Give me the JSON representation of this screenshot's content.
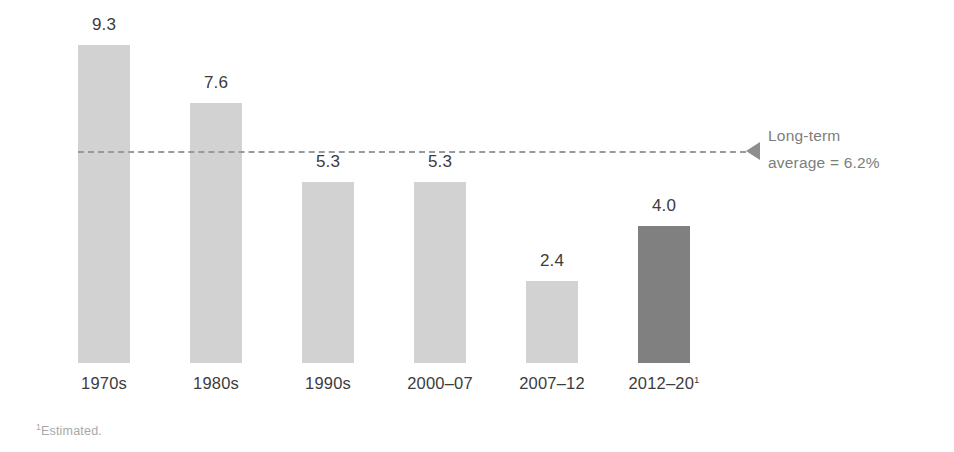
{
  "chart_data": {
    "type": "bar",
    "title": "",
    "subtitle": "",
    "xlabel": "",
    "ylabel": "",
    "categories": [
      "1970s",
      "1980s",
      "1990s",
      "2000–07",
      "2007–12",
      "2012–20"
    ],
    "category_labels": [
      "1970s",
      "1980s",
      "1990s",
      "2000–07",
      "2007–12",
      "2012–20"
    ],
    "category_footnote_markers": [
      "",
      "",
      "",
      "",
      "",
      "1"
    ],
    "values": [
      9.3,
      7.6,
      5.3,
      5.3,
      2.4,
      4.0
    ],
    "value_labels": [
      "9.3",
      "7.6",
      "5.3",
      "5.3",
      "2.4",
      "4.0"
    ],
    "bar_colors": [
      "#d2d2d2",
      "#d2d2d2",
      "#d2d2d2",
      "#d2d2d2",
      "#d2d2d2",
      "#808080"
    ],
    "highlighted_index": 5,
    "ylim": [
      0,
      9.3
    ],
    "grid": false,
    "legend": null,
    "units": "percent",
    "reference_line": {
      "value": 6.2,
      "label_line1": "Long-term",
      "label_line2": "average = 6.2%",
      "style": "dashed",
      "color": "#9a9a9a",
      "arrow": "left-triangle"
    },
    "annotations": [
      {
        "text": "¹Estimated.",
        "position": "bottom-left"
      }
    ]
  },
  "footnote": {
    "marker": "1",
    "text": "Estimated."
  },
  "reference": {
    "line1": "Long-term",
    "line2": "average = 6.2%"
  },
  "colors": {
    "bar_light": "#d2d2d2",
    "bar_highlight": "#808080",
    "reference_line": "#9a9a9a",
    "value_text": "#3c3c3c",
    "category_text": "#3c3c3c",
    "reference_text": "#7d7d7d",
    "footnote_text": "#a8a8a8",
    "background": "#ffffff"
  }
}
